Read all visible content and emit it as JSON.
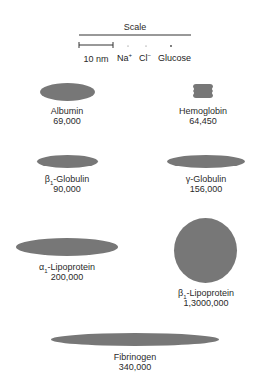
{
  "scale": {
    "title": "Scale",
    "bar_label": "10 nm",
    "ions": [
      {
        "name": "Na",
        "charge": "+"
      },
      {
        "name": "Cl",
        "charge": "−"
      },
      {
        "name": "Glucose",
        "charge": ""
      }
    ]
  },
  "colors": {
    "shape_fill": "#777777",
    "text": "#2a2a2a",
    "line": "#333333"
  },
  "proteins": [
    {
      "id": "albumin",
      "prefix": "",
      "sub": "",
      "name": "Albumin",
      "mw": "69,000",
      "shape": "ellipse"
    },
    {
      "id": "hemoglobin",
      "prefix": "",
      "sub": "",
      "name": "Hemoglobin",
      "mw": "64,450",
      "shape": "notched-rect"
    },
    {
      "id": "beta1-globulin",
      "prefix": "β",
      "sub": "1",
      "name": "-Globulin",
      "mw": "90,000",
      "shape": "ellipse"
    },
    {
      "id": "gamma-globulin",
      "prefix": "γ",
      "sub": "",
      "name": "-Globulin",
      "mw": "156,000",
      "shape": "ellipse"
    },
    {
      "id": "alpha1-lipoprotein",
      "prefix": "α",
      "sub": "1",
      "name": "-Lipoprotein",
      "mw": "200,000",
      "shape": "ellipse"
    },
    {
      "id": "beta1-lipoprotein",
      "prefix": "β",
      "sub": "1",
      "name": "-Lipoprotein",
      "mw": "1,3000,000",
      "shape": "circle"
    },
    {
      "id": "fibrinogen",
      "prefix": "",
      "sub": "",
      "name": "Fibrinogen",
      "mw": "340,000",
      "shape": "ellipse"
    }
  ]
}
